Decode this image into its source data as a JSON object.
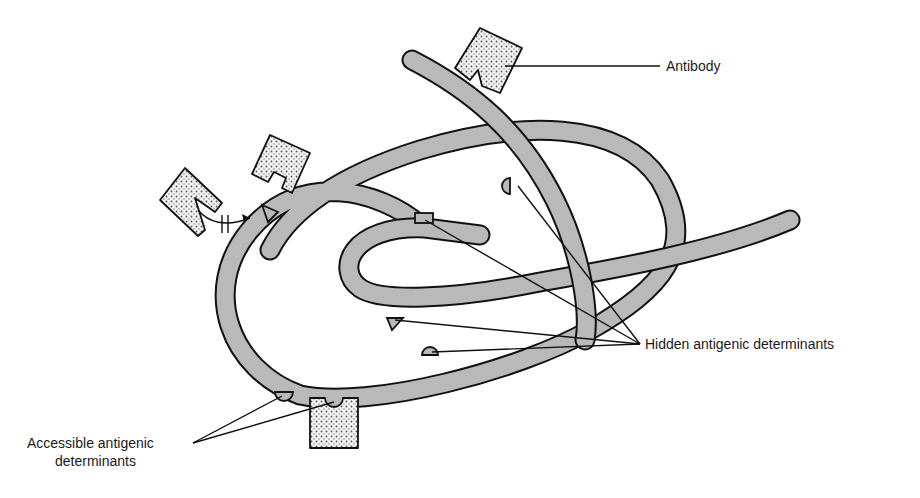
{
  "figure": {
    "labels": {
      "antibody": "Antibody",
      "hidden": "Hidden antigenic determinants",
      "accessible_line1": "Accessible antigenic",
      "accessible_line2": "determinants"
    },
    "colors": {
      "strand_fill": "#b9b9b9",
      "strand_outline": "#111111",
      "antibody_fill": "#f2f2f2",
      "antibody_dots": "#555555",
      "background": "#ffffff"
    },
    "elements": {
      "antibodies_count": 4,
      "hidden_determinants_count": 4,
      "accessible_determinants_count": 2,
      "blocked_binding_symbol": "no-binding (crossed arrow)"
    }
  }
}
